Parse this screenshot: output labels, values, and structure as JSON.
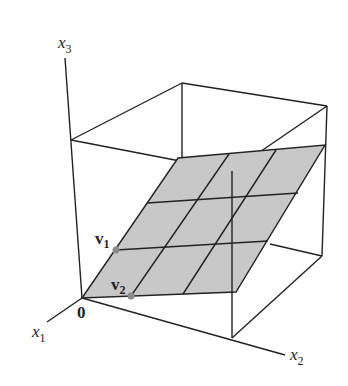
{
  "figure": {
    "type": "3d-box-with-plane",
    "axes": {
      "x1": {
        "label": "x",
        "subscript": "1"
      },
      "x2": {
        "label": "x",
        "subscript": "2"
      },
      "x3": {
        "label": "x",
        "subscript": "3"
      }
    },
    "origin_label": "0",
    "vectors": [
      {
        "label": "v",
        "subscript": "1"
      },
      {
        "label": "v",
        "subscript": "2"
      }
    ],
    "colors": {
      "plane_fill": "#c8c8c8",
      "line": "#222222",
      "point": "#8a8a8a",
      "background": "#ffffff"
    }
  }
}
